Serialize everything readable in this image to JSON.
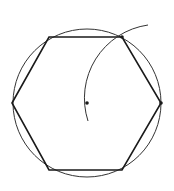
{
  "diagram": {
    "colors": {
      "stroke": "#1a1a1a",
      "background": "#ffffff"
    },
    "circle": {
      "cx": 87,
      "cy": 103,
      "r": 74
    },
    "hexagon_points": "12,103 49,37 122,37 161,103 122,170 49,170",
    "arc_path": "M 88 121 A 74 74 0 0 1 148 25",
    "points": [
      {
        "name": "center",
        "x": 87,
        "y": 103
      },
      {
        "name": "right-vertex",
        "x": 161,
        "y": 103
      },
      {
        "name": "top-right-vertex",
        "x": 122,
        "y": 37
      }
    ]
  }
}
